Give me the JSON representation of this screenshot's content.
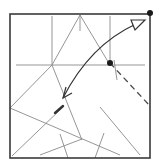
{
  "diagram": {
    "type": "origami-fold-diagram",
    "colors": {
      "background": "#ffffff",
      "border": "#3a3a3a",
      "crease": "#8a8a8a",
      "arrow": "#333333",
      "dot": "#1a1a1a",
      "dashed": "#4a4a4a"
    },
    "square": {
      "x": 10,
      "y": 14,
      "width": 140,
      "height": 144
    },
    "dots": [
      {
        "name": "corner-dot",
        "cx": 150,
        "cy": 13,
        "r": 3
      },
      {
        "name": "target-dot",
        "cx": 110,
        "cy": 63,
        "r": 3
      }
    ],
    "creases": [
      {
        "x1": 80,
        "y1": 15,
        "x2": 80,
        "y2": 31
      },
      {
        "x1": 52,
        "y1": 16,
        "x2": 52,
        "y2": 65
      },
      {
        "x1": 110,
        "y1": 16,
        "x2": 110,
        "y2": 60
      },
      {
        "x1": 16,
        "y1": 65,
        "x2": 145,
        "y2": 65
      },
      {
        "x1": 80,
        "y1": 15,
        "x2": 52,
        "y2": 65
      },
      {
        "x1": 80,
        "y1": 15,
        "x2": 110,
        "y2": 65
      },
      {
        "x1": 52,
        "y1": 65,
        "x2": 82,
        "y2": 140
      },
      {
        "x1": 52,
        "y1": 65,
        "x2": 10,
        "y2": 108
      },
      {
        "x1": 10,
        "y1": 108,
        "x2": 120,
        "y2": 155
      },
      {
        "x1": 12,
        "y1": 156,
        "x2": 63,
        "y2": 107
      },
      {
        "x1": 60,
        "y1": 134,
        "x2": 68,
        "y2": 158
      },
      {
        "x1": 40,
        "y1": 155,
        "x2": 82,
        "y2": 139
      },
      {
        "x1": 95,
        "y1": 158,
        "x2": 104,
        "y2": 133
      },
      {
        "x1": 100,
        "y1": 107,
        "x2": 140,
        "y2": 155
      },
      {
        "x1": 114,
        "y1": 60,
        "x2": 117,
        "y2": 80
      }
    ],
    "bold_segment": {
      "x1": 55,
      "y1": 113,
      "x2": 63,
      "y2": 106
    },
    "dashed_line": {
      "x1": 110,
      "y1": 63,
      "x2": 150,
      "y2": 106
    },
    "arrow": {
      "path": "M 63 98 Q 90 45 136 24",
      "head_start": "M 66 87 L 63 98 L 72 93",
      "head_end_hollow": "M 131 20 L 145 20 L 135 30 Z"
    }
  }
}
